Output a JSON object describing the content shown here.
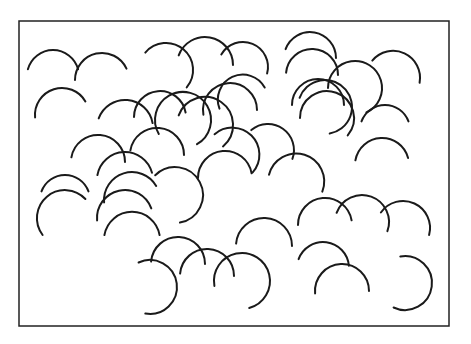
{
  "figure": {
    "stroke_color": "#1a1a1a",
    "background_color": "#ffffff",
    "frame": {
      "x": 19,
      "y": 21,
      "width": 430,
      "height": 305
    },
    "arcs": [
      {
        "cx": 53,
        "cy": 76,
        "r": 26,
        "a0": 195,
        "a1": 345
      },
      {
        "cx": 102,
        "cy": 80,
        "r": 27,
        "a0": 180,
        "a1": 335
      },
      {
        "cx": 62,
        "cy": 115,
        "r": 27,
        "a0": 175,
        "a1": 330
      },
      {
        "cx": 125,
        "cy": 128,
        "r": 28,
        "a0": 200,
        "a1": 350
      },
      {
        "cx": 166,
        "cy": 70,
        "r": 27,
        "a0": 220,
        "a1": 400
      },
      {
        "cx": 205,
        "cy": 65,
        "r": 28,
        "a0": 200,
        "a1": 360
      },
      {
        "cx": 243,
        "cy": 67,
        "r": 25,
        "a0": 210,
        "a1": 375
      },
      {
        "cx": 160,
        "cy": 117,
        "r": 26,
        "a0": 180,
        "a1": 350
      },
      {
        "cx": 183,
        "cy": 120,
        "r": 28,
        "a0": 150,
        "a1": 420
      },
      {
        "cx": 205,
        "cy": 125,
        "r": 28,
        "a0": 200,
        "a1": 410
      },
      {
        "cx": 230,
        "cy": 110,
        "r": 27,
        "a0": 170,
        "a1": 360
      },
      {
        "cx": 243,
        "cy": 100,
        "r": 25,
        "a0": 160,
        "a1": 330
      },
      {
        "cx": 157,
        "cy": 155,
        "r": 27,
        "a0": 190,
        "a1": 360
      },
      {
        "cx": 98,
        "cy": 162,
        "r": 27,
        "a0": 190,
        "a1": 360
      },
      {
        "cx": 65,
        "cy": 200,
        "r": 25,
        "a0": 200,
        "a1": 340
      },
      {
        "cx": 64,
        "cy": 217,
        "r": 28,
        "a0": 140,
        "a1": 320
      },
      {
        "cx": 132,
        "cy": 200,
        "r": 28,
        "a0": 175,
        "a1": 330
      },
      {
        "cx": 125,
        "cy": 180,
        "r": 28,
        "a0": 190,
        "a1": 345
      },
      {
        "cx": 175,
        "cy": 195,
        "r": 28,
        "a0": 225,
        "a1": 440
      },
      {
        "cx": 225,
        "cy": 178,
        "r": 27,
        "a0": 180,
        "a1": 350
      },
      {
        "cx": 232,
        "cy": 155,
        "r": 27,
        "a0": 230,
        "a1": 400
      },
      {
        "cx": 268,
        "cy": 150,
        "r": 26,
        "a0": 230,
        "a1": 380
      },
      {
        "cx": 296,
        "cy": 182,
        "r": 28,
        "a0": 195,
        "a1": 380
      },
      {
        "cx": 318,
        "cy": 105,
        "r": 26,
        "a0": 180,
        "a1": 360
      },
      {
        "cx": 310,
        "cy": 58,
        "r": 26,
        "a0": 200,
        "a1": 360
      },
      {
        "cx": 312,
        "cy": 75,
        "r": 26,
        "a0": 185,
        "a1": 360
      },
      {
        "cx": 355,
        "cy": 88,
        "r": 27,
        "a0": 180,
        "a1": 425
      },
      {
        "cx": 393,
        "cy": 78,
        "r": 27,
        "a0": 220,
        "a1": 370
      },
      {
        "cx": 385,
        "cy": 130,
        "r": 25,
        "a0": 200,
        "a1": 340
      },
      {
        "cx": 382,
        "cy": 165,
        "r": 27,
        "a0": 190,
        "a1": 345
      },
      {
        "cx": 325,
        "cy": 107,
        "r": 27,
        "a0": 200,
        "a1": 440
      },
      {
        "cx": 327,
        "cy": 118,
        "r": 27,
        "a0": 180,
        "a1": 400
      },
      {
        "cx": 325,
        "cy": 225,
        "r": 27,
        "a0": 180,
        "a1": 350
      },
      {
        "cx": 362,
        "cy": 222,
        "r": 27,
        "a0": 200,
        "a1": 380
      },
      {
        "cx": 403,
        "cy": 228,
        "r": 27,
        "a0": 215,
        "a1": 375
      },
      {
        "cx": 264,
        "cy": 246,
        "r": 28,
        "a0": 185,
        "a1": 360
      },
      {
        "cx": 242,
        "cy": 281,
        "r": 28,
        "a0": 170,
        "a1": 435
      },
      {
        "cx": 323,
        "cy": 268,
        "r": 26,
        "a0": 200,
        "a1": 355
      },
      {
        "cx": 342,
        "cy": 291,
        "r": 27,
        "a0": 175,
        "a1": 360
      },
      {
        "cx": 405,
        "cy": 283,
        "r": 27,
        "a0": 260,
        "a1": 475
      },
      {
        "cx": 132,
        "cy": 240,
        "r": 28,
        "a0": 190,
        "a1": 350
      },
      {
        "cx": 150,
        "cy": 287,
        "r": 27,
        "a0": 245,
        "a1": 460
      },
      {
        "cx": 178,
        "cy": 264,
        "r": 27,
        "a0": 185,
        "a1": 360
      },
      {
        "cx": 207,
        "cy": 276,
        "r": 27,
        "a0": 185,
        "a1": 360
      },
      {
        "cx": 125,
        "cy": 218,
        "r": 28,
        "a0": 175,
        "a1": 340
      }
    ]
  }
}
